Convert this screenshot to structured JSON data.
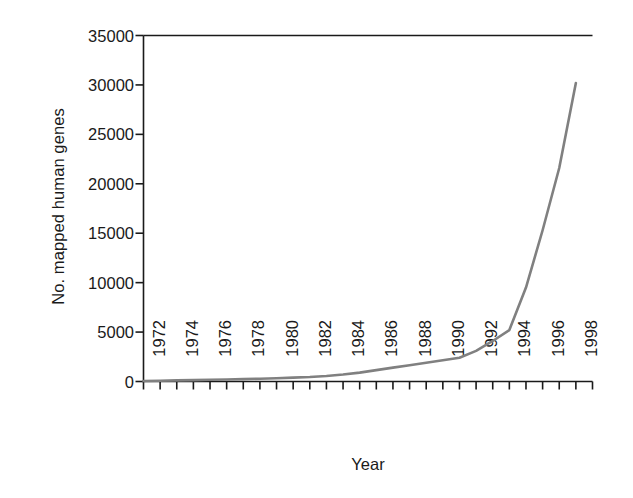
{
  "chart_data": {
    "type": "line",
    "title": "",
    "xlabel": "Year",
    "ylabel": "No. mapped human genes",
    "xlim": [
      1972,
      1999
    ],
    "ylim": [
      0,
      35000
    ],
    "grid": false,
    "legend": null,
    "line_color": "#808080",
    "axis_color": "#1a1a1a",
    "y_ticks": [
      0,
      5000,
      10000,
      15000,
      20000,
      25000,
      30000,
      35000
    ],
    "y_tick_labels": [
      "0",
      "5000",
      "10000",
      "15000",
      "20000",
      "25000",
      "30000",
      "35000"
    ],
    "x_ticks": [
      1972,
      1973,
      1974,
      1975,
      1976,
      1977,
      1978,
      1979,
      1980,
      1981,
      1982,
      1983,
      1984,
      1985,
      1986,
      1987,
      1988,
      1989,
      1990,
      1991,
      1992,
      1993,
      1994,
      1995,
      1996,
      1997,
      1998,
      1999
    ],
    "x_tick_labels": [
      "1972",
      "1974",
      "1976",
      "1978",
      "1980",
      "1982",
      "1984",
      "1986",
      "1988",
      "1990",
      "1992",
      "1994",
      "1996",
      "1998"
    ],
    "x_labeled_ticks": [
      1972,
      1974,
      1976,
      1978,
      1980,
      1982,
      1984,
      1986,
      1988,
      1990,
      1992,
      1994,
      1996,
      1998
    ],
    "x": [
      1972,
      1973,
      1974,
      1975,
      1976,
      1977,
      1978,
      1979,
      1980,
      1981,
      1982,
      1983,
      1984,
      1985,
      1986,
      1987,
      1988,
      1989,
      1990,
      1991,
      1992,
      1993,
      1994,
      1995,
      1996,
      1997,
      1998
    ],
    "values": [
      50,
      80,
      110,
      140,
      170,
      200,
      240,
      280,
      330,
      390,
      450,
      550,
      700,
      900,
      1150,
      1400,
      1650,
      1900,
      2150,
      2400,
      3100,
      4100,
      5200,
      9500,
      15300,
      21600,
      30200
    ],
    "series": [
      {
        "name": "No. mapped human genes",
        "color": "#808080",
        "values": [
          50,
          80,
          110,
          140,
          170,
          200,
          240,
          280,
          330,
          390,
          450,
          550,
          700,
          900,
          1150,
          1400,
          1650,
          1900,
          2150,
          2400,
          3100,
          4100,
          5200,
          9500,
          15300,
          21600,
          30200
        ]
      }
    ]
  }
}
